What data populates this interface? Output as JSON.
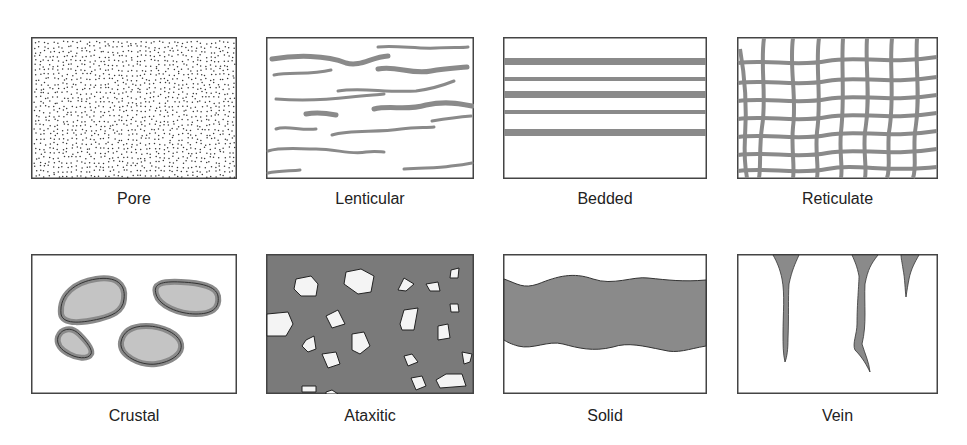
{
  "figure": {
    "colors": {
      "border": "#444444",
      "gray": "#8c8c8c",
      "dark_fill": "#7a7a7a",
      "light_fill": "#c4c4c4",
      "dot": "#333333"
    },
    "panels": [
      {
        "id": "pore",
        "label": "Pore"
      },
      {
        "id": "lenticular",
        "label": "Lenticular"
      },
      {
        "id": "bedded",
        "label": "Bedded"
      },
      {
        "id": "reticulate",
        "label": "Reticulate"
      },
      {
        "id": "crustal",
        "label": "Crustal"
      },
      {
        "id": "ataxitic",
        "label": "Ataxitic"
      },
      {
        "id": "solid",
        "label": "Solid"
      },
      {
        "id": "vein",
        "label": "Vein"
      }
    ]
  }
}
